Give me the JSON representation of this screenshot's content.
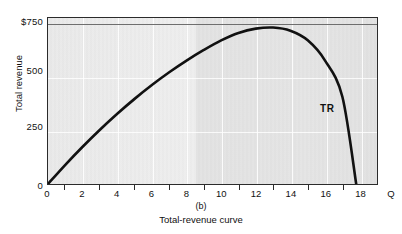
{
  "chart_data": {
    "type": "line",
    "title": "Total-revenue curve",
    "panel_label": "(b)",
    "xlabel": "Q",
    "ylabel": "Total revenue",
    "xlim": [
      0,
      19
    ],
    "ylim": [
      0,
      780
    ],
    "grid": true,
    "legend_position": "inline-right",
    "x_tick_labels": [
      "0",
      "2",
      "4",
      "6",
      "8",
      "10",
      "12",
      "14",
      "16",
      "18"
    ],
    "x_tick_values": [
      0,
      2,
      4,
      6,
      8,
      10,
      12,
      14,
      16,
      18
    ],
    "x_minor_tick_values": [
      1,
      3,
      5,
      7,
      9,
      11,
      13,
      15,
      17
    ],
    "y_tick_labels": [
      "0",
      "250",
      "500",
      "$750"
    ],
    "y_tick_values": [
      0,
      250,
      500,
      750
    ],
    "max_revenue_reference_line": 750,
    "series": [
      {
        "name": "TR",
        "annotation": "TR",
        "x": [
          0,
          1,
          2,
          3,
          4,
          5,
          6,
          7,
          8,
          9,
          10,
          11,
          12,
          13,
          14,
          15,
          16,
          17,
          17.8
        ],
        "values": [
          0,
          90,
          175,
          255,
          330,
          400,
          465,
          525,
          580,
          630,
          675,
          710,
          730,
          735,
          720,
          675,
          580,
          410,
          0
        ]
      }
    ],
    "annotations": [
      "TR"
    ]
  },
  "axis": {
    "y_title": "Total revenue",
    "x_title": "Q"
  },
  "caption": {
    "panel": "(b)",
    "text": "Total-revenue curve"
  },
  "colors": {
    "curve": "#111111",
    "plot_background": "#e6e6e6",
    "frame": "#2b2b2b",
    "gridline": "#ffffff"
  }
}
